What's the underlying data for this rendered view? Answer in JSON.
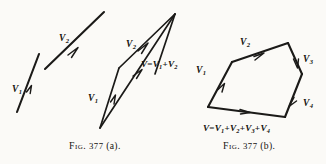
{
  "plate": {
    "background_color": "#fbfaf7",
    "ink_color": "#1b1a18"
  },
  "figure_a": {
    "caption_prefix": "Fig.",
    "caption_number": "377",
    "caption_suffix": "(a).",
    "given_vectors": {
      "v1_label": "V",
      "v1_sub": "1",
      "v2_label": "V",
      "v2_sub": "2"
    },
    "parallelogram": {
      "v1_label": "V",
      "v1_sub": "1",
      "v2_label": "V",
      "v2_sub": "2",
      "resultant": {
        "lhs": "V",
        "equals": "=",
        "term1": "V",
        "term1_sub": "1",
        "plus": "+",
        "term2": "V",
        "term2_sub": "2"
      }
    }
  },
  "figure_b": {
    "caption_prefix": "Fig.",
    "caption_number": "377",
    "caption_suffix": "(b).",
    "edge_labels": [
      {
        "label": "V",
        "sub": "1"
      },
      {
        "label": "V",
        "sub": "2"
      },
      {
        "label": "V",
        "sub": "3"
      },
      {
        "label": "V",
        "sub": "4"
      }
    ],
    "resultant": {
      "lhs": "V",
      "equals": "=",
      "term1": "V",
      "term1_sub": "1",
      "plus1": "+",
      "term2": "V",
      "term2_sub": "2",
      "plus2": "+",
      "term3": "V",
      "term3_sub": "3",
      "plus3": "+",
      "term4": "V",
      "term4_sub": "4"
    }
  }
}
